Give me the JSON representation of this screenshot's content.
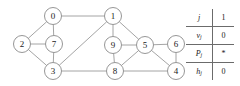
{
  "figure": {
    "type": "graph-with-state-table",
    "node_radius": 8.5,
    "node_fill": "#ffffff",
    "node_stroke": "#8a8a8a",
    "edge_color": "#9a9a9a",
    "label_color": "#1a1a1a"
  },
  "graph": {
    "nodes": [
      {
        "id": "0",
        "label": "0",
        "x": 53,
        "y": 16
      },
      {
        "id": "1",
        "label": "1",
        "x": 113,
        "y": 16
      },
      {
        "id": "2",
        "label": "2",
        "x": 22,
        "y": 44
      },
      {
        "id": "7",
        "label": "7",
        "x": 54,
        "y": 44
      },
      {
        "id": "9",
        "label": "9",
        "x": 113,
        "y": 45
      },
      {
        "id": "5",
        "label": "5",
        "x": 145,
        "y": 45
      },
      {
        "id": "6",
        "label": "6",
        "x": 176,
        "y": 44
      },
      {
        "id": "3",
        "label": "3",
        "x": 53,
        "y": 71
      },
      {
        "id": "8",
        "label": "8",
        "x": 115,
        "y": 71
      },
      {
        "id": "4",
        "label": "4",
        "x": 176,
        "y": 71
      }
    ],
    "edges": [
      {
        "from": "0",
        "to": "1"
      },
      {
        "from": "0",
        "to": "2"
      },
      {
        "from": "0",
        "to": "7"
      },
      {
        "from": "2",
        "to": "7"
      },
      {
        "from": "2",
        "to": "3"
      },
      {
        "from": "7",
        "to": "3"
      },
      {
        "from": "1",
        "to": "3"
      },
      {
        "from": "1",
        "to": "9"
      },
      {
        "from": "1",
        "to": "5"
      },
      {
        "from": "9",
        "to": "5"
      },
      {
        "from": "9",
        "to": "8"
      },
      {
        "from": "5",
        "to": "6"
      },
      {
        "from": "5",
        "to": "8"
      },
      {
        "from": "5",
        "to": "4"
      },
      {
        "from": "6",
        "to": "4"
      },
      {
        "from": "3",
        "to": "8"
      },
      {
        "from": "8",
        "to": "4"
      }
    ]
  },
  "state_table": {
    "rows": [
      {
        "label": "j",
        "sub": "",
        "value": "1"
      },
      {
        "label": "v",
        "sub": "j",
        "value": "0"
      },
      {
        "label": "P",
        "sub": "j",
        "value": "*"
      },
      {
        "label": "h",
        "sub": "j",
        "value": "0"
      }
    ]
  }
}
